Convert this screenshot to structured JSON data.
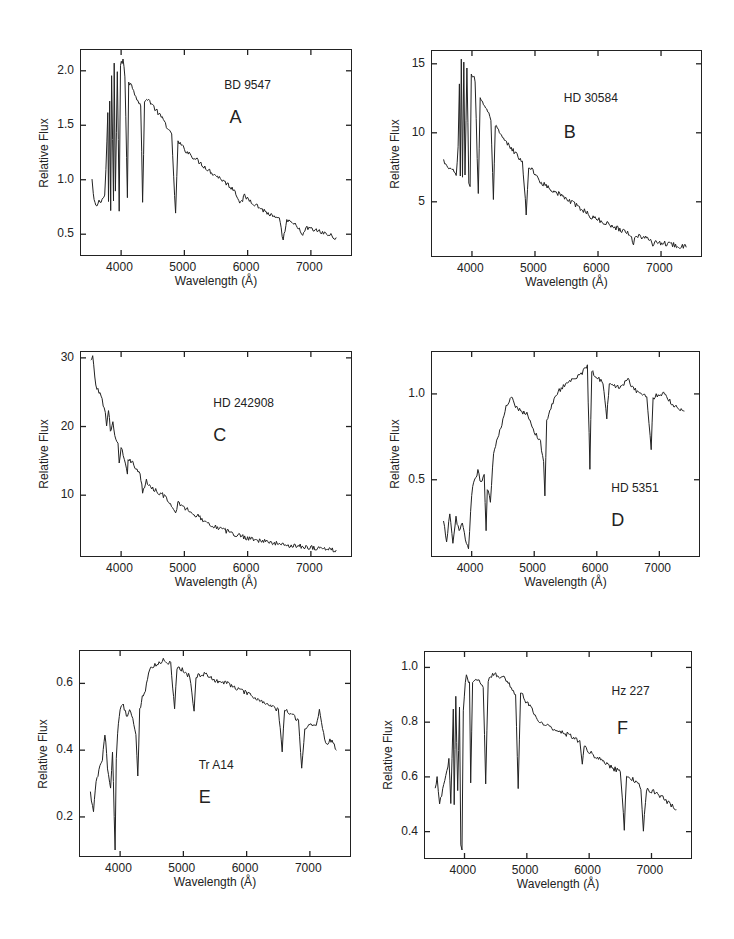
{
  "figure": {
    "background": "#ffffff",
    "ink": "#222222"
  },
  "chart_data": [
    {
      "id": "A",
      "type": "line",
      "star": "BD 9547",
      "letter": "A",
      "xlabel": "Wavelength (Å)",
      "ylabel": "Relative Flux",
      "xlim": [
        3350,
        7650
      ],
      "ylim": [
        0.3,
        2.2
      ],
      "xticks": [
        4000,
        5000,
        6000,
        7000
      ],
      "yticks": [
        0.5,
        1.0,
        1.5,
        2.0
      ],
      "ytick_labels": [
        "0.5",
        "1.0",
        "1.5",
        "2.0"
      ],
      "frame": {
        "x": 80,
        "y": 49,
        "w": 272,
        "h": 207
      },
      "label_pos": {
        "star": [
          0.53,
          0.14
        ],
        "letter": [
          0.55,
          0.28
        ]
      },
      "series": [
        [
          3540,
          1.0
        ],
        [
          3560,
          0.85
        ],
        [
          3600,
          0.75
        ],
        [
          3650,
          0.8
        ],
        [
          3700,
          0.82
        ],
        [
          3740,
          0.85
        ],
        [
          3760,
          1.1
        ],
        [
          3790,
          1.6
        ],
        [
          3800,
          0.8
        ],
        [
          3820,
          1.7
        ],
        [
          3835,
          0.72
        ],
        [
          3850,
          1.95
        ],
        [
          3880,
          0.8
        ],
        [
          3890,
          2.05
        ],
        [
          3910,
          0.9
        ],
        [
          3940,
          2.0
        ],
        [
          3970,
          0.72
        ],
        [
          3990,
          2.05
        ],
        [
          4030,
          2.1
        ],
        [
          4060,
          1.95
        ],
        [
          4100,
          0.85
        ],
        [
          4120,
          1.9
        ],
        [
          4180,
          1.85
        ],
        [
          4250,
          1.75
        ],
        [
          4310,
          1.68
        ],
        [
          4340,
          0.8
        ],
        [
          4370,
          1.7
        ],
        [
          4420,
          1.75
        ],
        [
          4500,
          1.68
        ],
        [
          4600,
          1.6
        ],
        [
          4700,
          1.52
        ],
        [
          4800,
          1.4
        ],
        [
          4861,
          0.68
        ],
        [
          4900,
          1.35
        ],
        [
          5000,
          1.28
        ],
        [
          5200,
          1.18
        ],
        [
          5400,
          1.08
        ],
        [
          5600,
          1.0
        ],
        [
          5800,
          0.9
        ],
        [
          5890,
          0.78
        ],
        [
          5950,
          0.85
        ],
        [
          6200,
          0.74
        ],
        [
          6400,
          0.66
        ],
        [
          6500,
          0.63
        ],
        [
          6563,
          0.45
        ],
        [
          6620,
          0.62
        ],
        [
          6800,
          0.57
        ],
        [
          6870,
          0.47
        ],
        [
          6920,
          0.56
        ],
        [
          7100,
          0.53
        ],
        [
          7250,
          0.5
        ],
        [
          7400,
          0.47
        ]
      ]
    },
    {
      "id": "B",
      "type": "line",
      "star": "HD 30584",
      "letter": "B",
      "xlabel": "Wavelength (Å)",
      "ylabel": "Relative Flux",
      "xlim": [
        3350,
        7650
      ],
      "ylim": [
        1.0,
        16.0
      ],
      "xticks": [
        4000,
        5000,
        6000,
        7000
      ],
      "yticks": [
        5,
        10,
        15
      ],
      "ytick_labels": [
        "5",
        "10",
        "15"
      ],
      "frame": {
        "x": 431,
        "y": 50,
        "w": 271,
        "h": 207
      },
      "label_pos": {
        "star": [
          0.49,
          0.2
        ],
        "letter": [
          0.49,
          0.35
        ]
      },
      "series": [
        [
          3550,
          8.0
        ],
        [
          3600,
          7.5
        ],
        [
          3700,
          7.2
        ],
        [
          3750,
          7.0
        ],
        [
          3780,
          9.0
        ],
        [
          3800,
          13.5
        ],
        [
          3815,
          6.8
        ],
        [
          3830,
          15.2
        ],
        [
          3850,
          6.8
        ],
        [
          3870,
          15.0
        ],
        [
          3890,
          7.0
        ],
        [
          3920,
          14.8
        ],
        [
          3950,
          6.5
        ],
        [
          3970,
          6.0
        ],
        [
          3990,
          14.3
        ],
        [
          4050,
          13.8
        ],
        [
          4100,
          5.5
        ],
        [
          4130,
          12.5
        ],
        [
          4200,
          12.0
        ],
        [
          4300,
          11.0
        ],
        [
          4340,
          5.0
        ],
        [
          4370,
          10.5
        ],
        [
          4500,
          9.5
        ],
        [
          4700,
          8.5
        ],
        [
          4800,
          7.8
        ],
        [
          4861,
          4.2
        ],
        [
          4900,
          7.6
        ],
        [
          5000,
          7.0
        ],
        [
          5100,
          6.4
        ],
        [
          5300,
          5.8
        ],
        [
          5500,
          5.2
        ],
        [
          5800,
          4.3
        ],
        [
          5890,
          3.9
        ],
        [
          6000,
          3.7
        ],
        [
          6300,
          3.1
        ],
        [
          6500,
          2.7
        ],
        [
          6563,
          2.0
        ],
        [
          6600,
          2.6
        ],
        [
          6850,
          2.2
        ],
        [
          6870,
          1.9
        ],
        [
          6900,
          2.1
        ],
        [
          7200,
          1.9
        ],
        [
          7400,
          1.7
        ]
      ]
    },
    {
      "id": "C",
      "type": "line",
      "star": "HD 242908",
      "letter": "C",
      "xlabel": "Wavelength (Å)",
      "ylabel": "Relative Flux",
      "xlim": [
        3350,
        7650
      ],
      "ylim": [
        1.0,
        31.0
      ],
      "xticks": [
        4000,
        5000,
        6000,
        7000
      ],
      "yticks": [
        10,
        20,
        30
      ],
      "ytick_labels": [
        "10",
        "20",
        "30"
      ],
      "frame": {
        "x": 80,
        "y": 351,
        "w": 272,
        "h": 206
      },
      "label_pos": {
        "star": [
          0.49,
          0.22
        ],
        "letter": [
          0.49,
          0.36
        ]
      },
      "series": [
        [
          3520,
          29.5
        ],
        [
          3550,
          30.0
        ],
        [
          3600,
          26.0
        ],
        [
          3650,
          25.0
        ],
        [
          3700,
          24.0
        ],
        [
          3750,
          22.0
        ],
        [
          3770,
          20.0
        ],
        [
          3800,
          22.5
        ],
        [
          3830,
          19.5
        ],
        [
          3870,
          20.5
        ],
        [
          3900,
          18.5
        ],
        [
          3950,
          17.5
        ],
        [
          3970,
          14.5
        ],
        [
          4000,
          17.0
        ],
        [
          4100,
          13.0
        ],
        [
          4110,
          15.5
        ],
        [
          4200,
          14.5
        ],
        [
          4300,
          13.0
        ],
        [
          4340,
          10.5
        ],
        [
          4400,
          12.0
        ],
        [
          4500,
          11.0
        ],
        [
          4700,
          9.8
        ],
        [
          4861,
          7.2
        ],
        [
          4900,
          9.0
        ],
        [
          5000,
          8.2
        ],
        [
          5200,
          7.0
        ],
        [
          5400,
          5.8
        ],
        [
          5600,
          5.0
        ],
        [
          5800,
          4.3
        ],
        [
          6000,
          3.8
        ],
        [
          6300,
          3.2
        ],
        [
          6563,
          2.8
        ],
        [
          6800,
          2.6
        ],
        [
          7000,
          2.4
        ],
        [
          7200,
          2.2
        ],
        [
          7400,
          2.0
        ]
      ]
    },
    {
      "id": "D",
      "type": "line",
      "star": "HD 5351",
      "letter": "D",
      "xlabel": "Wavelength (Å)",
      "ylabel": "Relative Flux",
      "xlim": [
        3350,
        7650
      ],
      "ylim": [
        0.05,
        1.25
      ],
      "xticks": [
        4000,
        5000,
        6000,
        7000
      ],
      "yticks": [
        0.5,
        1.0
      ],
      "ytick_labels": [
        "0.5",
        "1.0"
      ],
      "frame": {
        "x": 431,
        "y": 351,
        "w": 269,
        "h": 206
      },
      "label_pos": {
        "star": [
          0.67,
          0.63
        ],
        "letter": [
          0.67,
          0.77
        ]
      },
      "series": [
        [
          3550,
          0.25
        ],
        [
          3600,
          0.15
        ],
        [
          3650,
          0.3
        ],
        [
          3700,
          0.12
        ],
        [
          3750,
          0.28
        ],
        [
          3800,
          0.2
        ],
        [
          3850,
          0.25
        ],
        [
          3900,
          0.15
        ],
        [
          3950,
          0.1
        ],
        [
          4000,
          0.42
        ],
        [
          4050,
          0.5
        ],
        [
          4100,
          0.55
        ],
        [
          4150,
          0.48
        ],
        [
          4200,
          0.52
        ],
        [
          4230,
          0.2
        ],
        [
          4250,
          0.45
        ],
        [
          4300,
          0.38
        ],
        [
          4350,
          0.65
        ],
        [
          4400,
          0.72
        ],
        [
          4450,
          0.78
        ],
        [
          4500,
          0.85
        ],
        [
          4550,
          0.92
        ],
        [
          4600,
          0.96
        ],
        [
          4650,
          0.99
        ],
        [
          4700,
          0.93
        ],
        [
          4800,
          0.9
        ],
        [
          4900,
          0.88
        ],
        [
          5000,
          0.78
        ],
        [
          5100,
          0.72
        ],
        [
          5150,
          0.6
        ],
        [
          5170,
          0.4
        ],
        [
          5200,
          0.85
        ],
        [
          5300,
          0.95
        ],
        [
          5400,
          1.02
        ],
        [
          5500,
          1.06
        ],
        [
          5600,
          1.08
        ],
        [
          5700,
          1.1
        ],
        [
          5800,
          1.14
        ],
        [
          5850,
          1.16
        ],
        [
          5890,
          0.57
        ],
        [
          5920,
          1.13
        ],
        [
          6000,
          1.1
        ],
        [
          6100,
          1.07
        ],
        [
          6160,
          0.86
        ],
        [
          6200,
          1.06
        ],
        [
          6300,
          1.04
        ],
        [
          6400,
          1.05
        ],
        [
          6500,
          1.08
        ],
        [
          6600,
          1.03
        ],
        [
          6700,
          1.0
        ],
        [
          6800,
          0.98
        ],
        [
          6870,
          0.68
        ],
        [
          6900,
          0.98
        ],
        [
          7000,
          1.0
        ],
        [
          7100,
          1.0
        ],
        [
          7200,
          0.94
        ],
        [
          7300,
          0.92
        ],
        [
          7400,
          0.9
        ]
      ]
    },
    {
      "id": "E",
      "type": "line",
      "star": "Tr A14",
      "letter": "E",
      "xlabel": "Wavelength (Å)",
      "ylabel": "Relative Flux",
      "xlim": [
        3350,
        7650
      ],
      "ylim": [
        0.08,
        0.7
      ],
      "xticks": [
        4000,
        5000,
        6000,
        7000
      ],
      "yticks": [
        0.2,
        0.4,
        0.6
      ],
      "ytick_labels": [
        "0.2",
        "0.4",
        "0.6"
      ],
      "frame": {
        "x": 79,
        "y": 650,
        "w": 272,
        "h": 207
      },
      "label_pos": {
        "star": [
          0.44,
          0.52
        ],
        "letter": [
          0.44,
          0.66
        ]
      },
      "series": [
        [
          3530,
          0.27
        ],
        [
          3580,
          0.22
        ],
        [
          3620,
          0.3
        ],
        [
          3680,
          0.35
        ],
        [
          3720,
          0.37
        ],
        [
          3760,
          0.45
        ],
        [
          3800,
          0.35
        ],
        [
          3850,
          0.28
        ],
        [
          3880,
          0.4
        ],
        [
          3920,
          0.1
        ],
        [
          3940,
          0.38
        ],
        [
          3960,
          0.45
        ],
        [
          4000,
          0.52
        ],
        [
          4050,
          0.54
        ],
        [
          4100,
          0.5
        ],
        [
          4150,
          0.52
        ],
        [
          4200,
          0.5
        ],
        [
          4250,
          0.45
        ],
        [
          4280,
          0.32
        ],
        [
          4310,
          0.52
        ],
        [
          4350,
          0.56
        ],
        [
          4400,
          0.58
        ],
        [
          4450,
          0.63
        ],
        [
          4500,
          0.65
        ],
        [
          4600,
          0.66
        ],
        [
          4700,
          0.67
        ],
        [
          4800,
          0.66
        ],
        [
          4861,
          0.52
        ],
        [
          4900,
          0.65
        ],
        [
          5000,
          0.64
        ],
        [
          5100,
          0.62
        ],
        [
          5170,
          0.52
        ],
        [
          5200,
          0.62
        ],
        [
          5300,
          0.63
        ],
        [
          5500,
          0.61
        ],
        [
          5700,
          0.6
        ],
        [
          5900,
          0.58
        ],
        [
          6100,
          0.56
        ],
        [
          6300,
          0.54
        ],
        [
          6500,
          0.52
        ],
        [
          6563,
          0.4
        ],
        [
          6600,
          0.52
        ],
        [
          6700,
          0.51
        ],
        [
          6820,
          0.49
        ],
        [
          6870,
          0.35
        ],
        [
          6920,
          0.46
        ],
        [
          7000,
          0.48
        ],
        [
          7100,
          0.47
        ],
        [
          7150,
          0.52
        ],
        [
          7250,
          0.42
        ],
        [
          7350,
          0.43
        ],
        [
          7420,
          0.4
        ]
      ]
    },
    {
      "id": "F",
      "type": "line",
      "star": "Hz 227",
      "letter": "F",
      "xlabel": "Wavelength (Å)",
      "ylabel": "Relative Flux",
      "xlim": [
        3350,
        7650
      ],
      "ylim": [
        0.3,
        1.06
      ],
      "xticks": [
        4000,
        5000,
        6000,
        7000
      ],
      "yticks": [
        0.4,
        0.6,
        0.8,
        1.0
      ],
      "ytick_labels": [
        "0.4",
        "0.6",
        "0.8",
        "1.0"
      ],
      "frame": {
        "x": 424,
        "y": 651,
        "w": 268,
        "h": 208
      },
      "label_pos": {
        "star": [
          0.7,
          0.16
        ],
        "letter": [
          0.72,
          0.32
        ]
      },
      "series": [
        [
          3530,
          0.55
        ],
        [
          3560,
          0.6
        ],
        [
          3600,
          0.5
        ],
        [
          3650,
          0.55
        ],
        [
          3700,
          0.6
        ],
        [
          3750,
          0.66
        ],
        [
          3780,
          0.5
        ],
        [
          3820,
          0.85
        ],
        [
          3835,
          0.5
        ],
        [
          3860,
          0.9
        ],
        [
          3890,
          0.55
        ],
        [
          3920,
          0.85
        ],
        [
          3940,
          0.35
        ],
        [
          3960,
          0.33
        ],
        [
          3980,
          0.85
        ],
        [
          4030,
          0.98
        ],
        [
          4080,
          0.94
        ],
        [
          4100,
          0.58
        ],
        [
          4130,
          0.95
        ],
        [
          4200,
          0.96
        ],
        [
          4300,
          0.92
        ],
        [
          4340,
          0.58
        ],
        [
          4380,
          0.95
        ],
        [
          4450,
          0.98
        ],
        [
          4550,
          0.97
        ],
        [
          4650,
          0.96
        ],
        [
          4750,
          0.93
        ],
        [
          4820,
          0.9
        ],
        [
          4861,
          0.55
        ],
        [
          4900,
          0.91
        ],
        [
          5000,
          0.87
        ],
        [
          5100,
          0.84
        ],
        [
          5200,
          0.8
        ],
        [
          5300,
          0.79
        ],
        [
          5500,
          0.77
        ],
        [
          5700,
          0.75
        ],
        [
          5850,
          0.73
        ],
        [
          5890,
          0.65
        ],
        [
          5920,
          0.72
        ],
        [
          6000,
          0.69
        ],
        [
          6200,
          0.66
        ],
        [
          6400,
          0.63
        ],
        [
          6500,
          0.62
        ],
        [
          6563,
          0.41
        ],
        [
          6600,
          0.61
        ],
        [
          6750,
          0.58
        ],
        [
          6830,
          0.56
        ],
        [
          6870,
          0.41
        ],
        [
          6920,
          0.55
        ],
        [
          7000,
          0.55
        ],
        [
          7150,
          0.53
        ],
        [
          7300,
          0.5
        ],
        [
          7400,
          0.48
        ]
      ]
    }
  ]
}
